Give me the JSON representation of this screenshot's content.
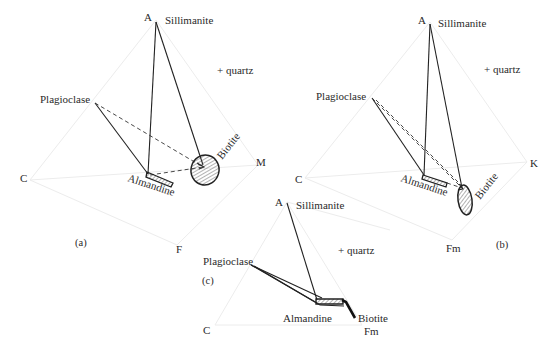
{
  "figure": {
    "panels": [
      {
        "id": "a",
        "caption": "(a)",
        "corners": {
          "top": "A",
          "left": "C",
          "right": "M",
          "bottom": "F"
        },
        "phases": [
          "Sillimanite",
          "Plagioclase",
          "Almandine",
          "Biotite"
        ],
        "note": "+ quartz"
      },
      {
        "id": "b",
        "caption": "(b)",
        "corners": {
          "top": "A",
          "left": "C",
          "right": "K",
          "bottom": "Fm"
        },
        "phases": [
          "Sillimanite",
          "Plagioclase",
          "Almandine",
          "Biotite"
        ],
        "note": "+ quartz"
      },
      {
        "id": "c",
        "caption": "(c)",
        "corners": {
          "top": "A",
          "left": "C",
          "right": "Fm",
          "side": "F"
        },
        "phases": [
          "Sillimanite",
          "Plagioclase",
          "Almandine",
          "Biotite"
        ],
        "note": "+ quartz"
      }
    ]
  },
  "labels": {
    "a": {
      "apex": "A",
      "sillimanite": "Sillimanite",
      "quartz": "+ quartz",
      "plagioclase": "Plagioclase",
      "biotite": "Biotite",
      "almandine": "Almandine",
      "corner_c": "C",
      "corner_m": "M",
      "corner_f": "F",
      "caption": "(a)"
    },
    "b": {
      "apex": "A",
      "sillimanite": "Sillimanite",
      "quartz": "+ quartz",
      "plagioclase": "Plagioclase",
      "biotite": "Biotite",
      "almandine": "Almandine",
      "corner_c": "C",
      "corner_k": "K",
      "corner_fm": "Fm",
      "caption": "(b)"
    },
    "c": {
      "apex": "A",
      "sillimanite": "Sillimanite",
      "quartz": "+ quartz",
      "plagioclase": "Plagioclase",
      "biotite": "Biotite",
      "almandine": "Almandine",
      "corner_c": "C",
      "corner_fm": "Fm",
      "caption": "(c)"
    }
  },
  "colors": {
    "line": "#222222",
    "hatch": "#555555",
    "faint_edges": "#ececec",
    "background": "#ffffff"
  }
}
